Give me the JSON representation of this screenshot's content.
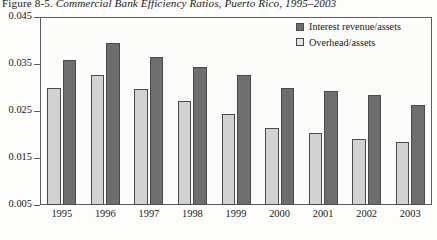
{
  "caption": {
    "label": "Figure 8-5.",
    "title": "Commercial Bank Efficiency Ratios, Puerto Rico, 1995–2003"
  },
  "legend": {
    "position": "top-right",
    "items": [
      {
        "name": "Interest revenue/assets",
        "swatch": "dark",
        "color": "#6e6e6e"
      },
      {
        "name": "Overhead/assets",
        "swatch": "light",
        "color": "#d2d2d2"
      }
    ]
  },
  "axis": {
    "y_ticks": [
      "0.045",
      "0.035",
      "0.025",
      "0.015",
      "0.005"
    ],
    "x_ticks": [
      "1995",
      "1996",
      "1997",
      "1998",
      "1999",
      "2000",
      "2001",
      "2002",
      "2003"
    ]
  },
  "chart_data": {
    "type": "bar",
    "title": "Commercial Bank Efficiency Ratios, Puerto Rico, 1995–2003",
    "xlabel": "",
    "ylabel": "",
    "ylim": [
      0.005,
      0.045
    ],
    "ytick_values": [
      0.045,
      0.035,
      0.025,
      0.015,
      0.005
    ],
    "grid": false,
    "legend_position": "top-right",
    "categories": [
      "1995",
      "1996",
      "1997",
      "1998",
      "1999",
      "2000",
      "2001",
      "2002",
      "2003"
    ],
    "series": [
      {
        "name": "Overhead/assets",
        "color": "#d2d2d2",
        "draw_order": 1,
        "values": [
          0.03,
          0.0327,
          0.0297,
          0.0272,
          0.0243,
          0.0213,
          0.0203,
          0.019,
          0.0184
        ]
      },
      {
        "name": "Interest revenue/assets",
        "color": "#6e6e6e",
        "draw_order": 2,
        "values": [
          0.0358,
          0.0394,
          0.0365,
          0.0343,
          0.0327,
          0.03,
          0.0292,
          0.0283,
          0.0263
        ]
      }
    ]
  }
}
